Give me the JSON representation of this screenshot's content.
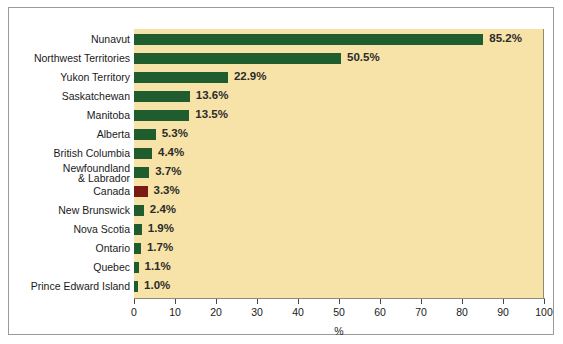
{
  "chart_data": {
    "type": "bar",
    "orientation": "horizontal",
    "title": "",
    "xlabel": "%",
    "ylabel": "",
    "xlim": [
      0,
      100
    ],
    "xticks": [
      0,
      10,
      20,
      30,
      40,
      50,
      60,
      70,
      80,
      90,
      100
    ],
    "xtick_labels": [
      "0",
      "10",
      "20",
      "30",
      "40",
      "50",
      "60",
      "70",
      "80",
      "90",
      "100"
    ],
    "grid": false,
    "legend": null,
    "categories": [
      "Nunavut",
      "Northwest Territories",
      "Yukon Territory",
      "Saskatchewan",
      "Manitoba",
      "Alberta",
      "British Columbia",
      "Newfoundland\n& Labrador",
      "Canada",
      "New Brunswick",
      "Nova Scotia",
      "Ontario",
      "Quebec",
      "Prince Edward Island"
    ],
    "values": [
      85.2,
      50.5,
      22.9,
      13.6,
      13.5,
      5.3,
      4.4,
      3.7,
      3.3,
      2.4,
      1.9,
      1.7,
      1.1,
      1.0
    ],
    "data_labels": [
      "85.2%",
      "50.5%",
      "22.9%",
      "13.6%",
      "13.5%",
      "5.3%",
      "4.4%",
      "3.7%",
      "3.3%",
      "2.4%",
      "1.9%",
      "1.7%",
      "1.1%",
      "1.0%"
    ],
    "highlight_category": "Canada",
    "colors": {
      "bar": "#1f5c2e",
      "highlight_bar": "#7a1a14",
      "plot_background": "#f7e3a8",
      "page_background": "#ffffff",
      "axis": "#8e8a78",
      "text": "#1a1a1a",
      "frame": "#9a9a96"
    }
  }
}
